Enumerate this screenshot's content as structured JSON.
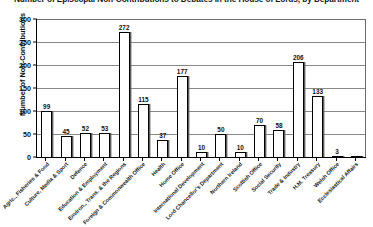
{
  "chart_data": {
    "type": "bar",
    "title": "Number of Episcopal Non-Contributions to Debates in the House of Lords, by Department",
    "xlabel": "",
    "ylabel": "Number of Non-Contributions",
    "ylim": [
      0,
      300
    ],
    "yticks": [
      0,
      50,
      100,
      150,
      200,
      250,
      300
    ],
    "ytick_labels": [
      "0",
      "50",
      "100",
      "150",
      "200",
      "250",
      "300"
    ],
    "grid": true,
    "legend": "none",
    "categories": [
      "Agric., Fisheries & Food",
      "Culture, Media & Sport",
      "Defence",
      "Education & Employment",
      "Environ., Trans. & the Regions",
      "Foreign & Commonwealth Office",
      "Health",
      "Home Office",
      "International Development",
      "Lord Chancellor's Department",
      "Northern Ireland",
      "Scottish Office",
      "Social Security",
      "Trade & Industry",
      "H.M. Treasury",
      "Welsh Office",
      "Ecclesiastical Affairs"
    ],
    "values": [
      99,
      45,
      52,
      53,
      272,
      115,
      37,
      177,
      10,
      50,
      10,
      70,
      58,
      206,
      133,
      3,
      0
    ],
    "value_labels": [
      "99",
      "45",
      "52",
      "53",
      "272",
      "115",
      "37",
      "177",
      "10",
      "50",
      "10",
      "70",
      "58",
      "206",
      "133",
      "3",
      ""
    ]
  }
}
